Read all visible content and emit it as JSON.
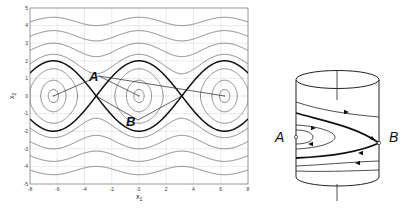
{
  "figure": {
    "left_panel": {
      "title": "Phase portrait",
      "xlabel": "x",
      "xlabel_sub": "1",
      "ylabel": "x",
      "ylabel_sub": "2",
      "xticks": [
        "-8",
        "-6",
        "-4",
        "-2",
        "0",
        "2",
        "4",
        "6",
        "8"
      ],
      "yticks": [
        "5",
        "4",
        "3",
        "2",
        "1",
        "0",
        "-1",
        "-2",
        "-3",
        "-4",
        "-5"
      ],
      "annotations": {
        "A": "A",
        "B": "B"
      }
    },
    "right_panel": {
      "title": "Cylinder phase space",
      "label_A": "A",
      "label_B": "B"
    },
    "colors": {
      "separatrix": "#111111",
      "orbit": "#6a6a6a",
      "grid": "#d6d6d6",
      "axis": "#555555"
    }
  },
  "chart_data": {
    "type": "line",
    "title": "",
    "xlabel": "x1",
    "ylabel": "x2",
    "xlim": [
      -8,
      8
    ],
    "ylim": [
      -5,
      5
    ],
    "grid": true,
    "centers_A": [
      [
        -6.283,
        0
      ],
      [
        0,
        0
      ],
      [
        6.283,
        0
      ]
    ],
    "saddles_B": [
      [
        -3.1416,
        0
      ],
      [
        3.1416,
        0
      ]
    ],
    "series": [
      {
        "name": "separatrix",
        "energy": 1.0,
        "style": "thick-black"
      },
      {
        "name": "closed-orbit-small",
        "energy": -0.93,
        "style": "thin-gray"
      },
      {
        "name": "closed-orbit-mid",
        "energy": -0.6,
        "style": "thin-gray"
      },
      {
        "name": "closed-orbit-large",
        "energy": 0.2,
        "style": "thin-gray"
      },
      {
        "name": "rotation-1",
        "energy": 1.8,
        "style": "thin-gray"
      },
      {
        "name": "rotation-2",
        "energy": 3.5,
        "style": "thin-gray"
      },
      {
        "name": "rotation-3",
        "energy": 5.9,
        "style": "thin-gray"
      },
      {
        "name": "rotation-4",
        "energy": 9.0,
        "style": "thin-gray"
      }
    ]
  }
}
